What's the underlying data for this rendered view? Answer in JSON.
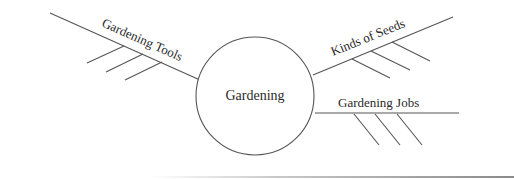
{
  "diagram": {
    "type": "spider-map",
    "center": {
      "label": "Gardening",
      "cx": 255,
      "cy": 96,
      "r": 59
    },
    "branches": [
      {
        "label": "Gardening Tools",
        "spoke": [
          50,
          13,
          200,
          80
        ],
        "label_pos": [
          101,
          26
        ],
        "label_rotate": 24,
        "details": [
          [
            124,
            46,
            87,
            63
          ],
          [
            143,
            54,
            106,
            72
          ],
          [
            162,
            62,
            125,
            80
          ]
        ]
      },
      {
        "label": "Kinds of Seeds",
        "spoke": [
          313,
          75,
          453,
          17
        ],
        "label_pos": [
          333,
          56
        ],
        "label_rotate": -22,
        "details": [
          [
            352,
            59,
            390,
            78
          ],
          [
            371,
            51,
            410,
            70
          ],
          [
            392,
            42,
            430,
            61
          ]
        ]
      },
      {
        "label": "Gardening Jobs",
        "spoke": [
          315,
          113,
          459,
          113
        ],
        "label_pos": [
          338,
          107
        ],
        "label_rotate": 0,
        "details": [
          [
            354,
            114,
            379,
            145
          ],
          [
            375,
            114,
            400,
            145
          ],
          [
            397,
            114,
            422,
            145
          ]
        ]
      }
    ],
    "colors": {
      "line": "#555555",
      "text": "#2a2a2a",
      "background": "#ffffff"
    }
  }
}
